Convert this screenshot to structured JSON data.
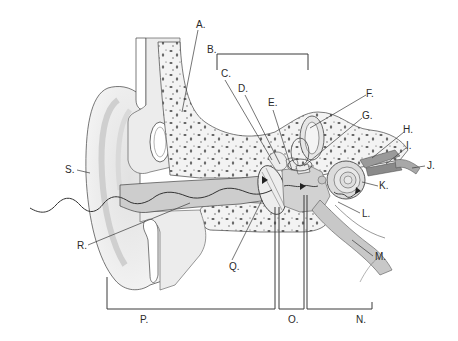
{
  "diagram": {
    "labels": {
      "A": {
        "text": "A.",
        "x": 196,
        "y": 20
      },
      "B": {
        "text": "B.",
        "x": 207,
        "y": 45
      },
      "C": {
        "text": "C.",
        "x": 221,
        "y": 69
      },
      "D": {
        "text": "D.",
        "x": 238,
        "y": 84
      },
      "E": {
        "text": "E.",
        "x": 268,
        "y": 98
      },
      "F": {
        "text": "F.",
        "x": 366,
        "y": 89
      },
      "G": {
        "text": "G.",
        "x": 362,
        "y": 111
      },
      "H": {
        "text": "H.",
        "x": 403,
        "y": 125
      },
      "I": {
        "text": "I.",
        "x": 406,
        "y": 141
      },
      "J": {
        "text": "J.",
        "x": 427,
        "y": 161
      },
      "K": {
        "text": "K.",
        "x": 379,
        "y": 181
      },
      "L": {
        "text": "L.",
        "x": 362,
        "y": 209
      },
      "M": {
        "text": "M.",
        "x": 375,
        "y": 252
      },
      "N": {
        "text": "N.",
        "x": 356,
        "y": 315
      },
      "O": {
        "text": "O.",
        "x": 288,
        "y": 315
      },
      "P": {
        "text": "P.",
        "x": 140,
        "y": 315
      },
      "Q": {
        "text": "Q.",
        "x": 229,
        "y": 262
      },
      "R": {
        "text": "R.",
        "x": 77,
        "y": 241
      },
      "S": {
        "text": "S.",
        "x": 65,
        "y": 165
      }
    },
    "colors": {
      "line": "#3a3a3a",
      "tissue_light": "#ececec",
      "tissue_mid": "#d6d6d6",
      "canal": "#c8c8c8",
      "bone": "#f3f3f3",
      "bone_speck": "#6a6a6a"
    }
  }
}
